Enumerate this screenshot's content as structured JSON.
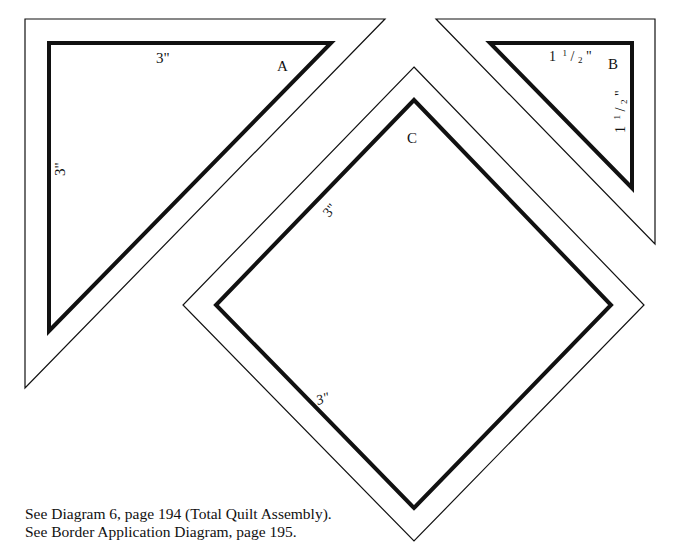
{
  "diagram": {
    "colors": {
      "background": "#ffffff",
      "outline": "#111111"
    },
    "pieces": [
      {
        "id": "A",
        "label": "A",
        "shape": "right-triangle",
        "side_labels": {
          "top": "3\"",
          "left": "3\""
        }
      },
      {
        "id": "B",
        "label": "B",
        "shape": "right-triangle",
        "side_labels": {
          "top": "1 1/2\"",
          "right": "1 1/2\""
        },
        "side_label_parts": {
          "whole": "1",
          "num": "1",
          "den": "2",
          "unit": "\""
        }
      },
      {
        "id": "C",
        "label": "C",
        "shape": "square-on-point",
        "side_labels": {
          "upper_left": "3\"",
          "lower_left": "3\""
        }
      }
    ]
  },
  "notes": [
    "See Diagram 6, page 194 (Total Quilt Assembly).",
    "See Border Application Diagram, page 195."
  ]
}
